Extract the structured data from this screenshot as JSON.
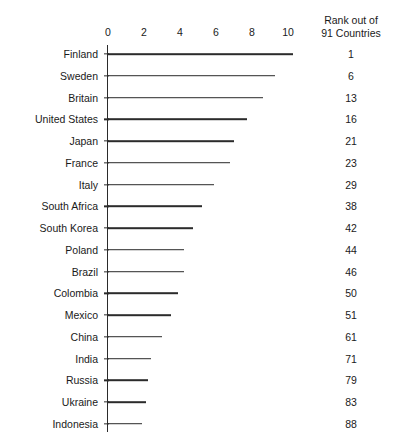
{
  "chart_data": {
    "type": "bar",
    "orientation": "horizontal",
    "title": "",
    "subtitle": "",
    "xlabel": "",
    "ylabel": "",
    "xlim": [
      0,
      10.4
    ],
    "xticks": [
      0,
      2,
      4,
      6,
      8,
      10
    ],
    "xtick_labels": [
      "0",
      "2",
      "4",
      "6",
      "8",
      "10"
    ],
    "grid": false,
    "legend": null,
    "categories": [
      "Finland",
      "Sweden",
      "Britain",
      "United States",
      "Japan",
      "France",
      "Italy",
      "South Africa",
      "South Korea",
      "Poland",
      "Brazil",
      "Colombia",
      "Mexico",
      "China",
      "India",
      "Russia",
      "Ukraine",
      "Indonesia"
    ],
    "values": [
      10.3,
      9.3,
      8.6,
      7.7,
      7.0,
      6.8,
      5.9,
      5.2,
      4.7,
      4.2,
      4.2,
      3.9,
      3.5,
      3.0,
      2.4,
      2.2,
      2.1,
      1.9
    ],
    "annotation_column": {
      "header_line1": "Rank out of",
      "header_line2": "91 Countries",
      "values": [
        "1",
        "6",
        "13",
        "16",
        "21",
        "23",
        "29",
        "38",
        "42",
        "44",
        "46",
        "50",
        "51",
        "61",
        "71",
        "79",
        "83",
        "88"
      ]
    },
    "colors": {
      "bar": "#2b2b2b",
      "axis": "#2b2b2b",
      "text": "#1a1a1a",
      "background": "#ffffff"
    }
  },
  "layout": {
    "axis_x_px": 108,
    "px_per_unit": 18,
    "first_row_y_px": 54,
    "row_spacing_px": 21.75
  }
}
